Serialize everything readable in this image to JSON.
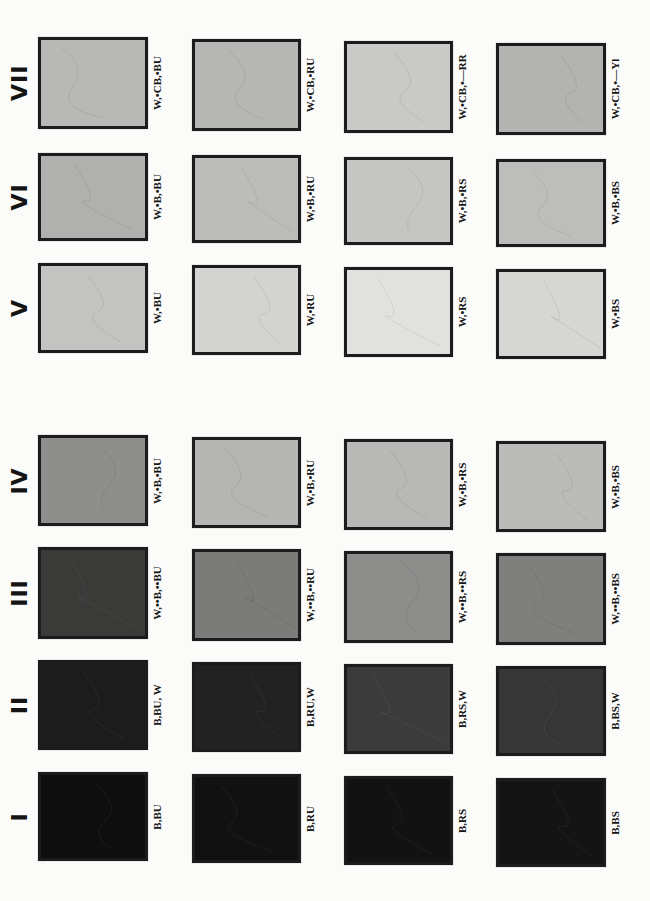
{
  "figure": {
    "rows": [
      {
        "numeral": "VII",
        "top": 37,
        "height": 92,
        "swatches": [
          {
            "label": "W,•CB,•BU",
            "color": "#b8b8b6"
          },
          {
            "label": "W,•CB,•RU",
            "color": "#b6b6b4"
          },
          {
            "label": "W,•CB,•—RR",
            "color": "#c9c9c7"
          },
          {
            "label": "W,•CB,•—Yl",
            "color": "#b3b3b1"
          }
        ]
      },
      {
        "numeral": "VI",
        "top": 153,
        "height": 88,
        "swatches": [
          {
            "label": "W,•B,•BU",
            "color": "#b0b0ae"
          },
          {
            "label": "W,•B,•RU",
            "color": "#bcbcba"
          },
          {
            "label": "W,•B,•RS",
            "color": "#c5c5c3"
          },
          {
            "label": "W,•B,•BS",
            "color": "#bdbdbb"
          }
        ]
      },
      {
        "numeral": "V",
        "top": 263,
        "height": 90,
        "swatches": [
          {
            "label": "W,•BU",
            "color": "#c3c3c1"
          },
          {
            "label": "W,•RU",
            "color": "#d3d3d1"
          },
          {
            "label": "W,•RS",
            "color": "#e1e1df"
          },
          {
            "label": "W,•BS",
            "color": "#d6d6d4"
          }
        ]
      },
      {
        "numeral": "IV",
        "top": 435,
        "height": 91,
        "swatches": [
          {
            "label": "W,•B,•BU",
            "color": "#8e8e8c"
          },
          {
            "label": "W,•B,•RU",
            "color": "#b5b5b3"
          },
          {
            "label": "W,•B,•RS",
            "color": "#b8b8b6"
          },
          {
            "label": "W,•B,•BS",
            "color": "#bbbbb9"
          }
        ]
      },
      {
        "numeral": "III",
        "top": 547,
        "height": 92,
        "swatches": [
          {
            "label": "W,••B,••BU",
            "color": "#3a3a39"
          },
          {
            "label": "W,••B,••RU",
            "color": "#7b7b7a"
          },
          {
            "label": "W,••B,••RS",
            "color": "#8d8d8c"
          },
          {
            "label": "W,••B,••BS",
            "color": "#7f7f7e"
          }
        ]
      },
      {
        "numeral": "II",
        "top": 660,
        "height": 90,
        "swatches": [
          {
            "label": "B,BU, W",
            "color": "#1c1c1c"
          },
          {
            "label": "B,RU,W",
            "color": "#222222"
          },
          {
            "label": "B,RS,W",
            "color": "#3b3b3b"
          },
          {
            "label": "B,BS,W",
            "color": "#363636"
          }
        ]
      },
      {
        "numeral": "I",
        "top": 772,
        "height": 89,
        "swatches": [
          {
            "label": "B,BU",
            "color": "#0e0e0e"
          },
          {
            "label": "B,RU",
            "color": "#111111"
          },
          {
            "label": "B,RS",
            "color": "#121212"
          },
          {
            "label": "B,BS",
            "color": "#141414"
          }
        ]
      }
    ],
    "columns": [
      {
        "left": 38,
        "width": 110
      },
      {
        "left": 192,
        "width": 109
      },
      {
        "left": 344,
        "width": 109
      },
      {
        "left": 496,
        "width": 110
      }
    ]
  }
}
